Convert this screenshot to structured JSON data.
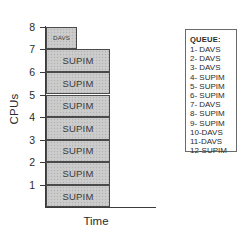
{
  "figure": {
    "y_axis_title": "CPUs",
    "x_axis_title": "Time",
    "y_ticks": [
      "1",
      "2",
      "3",
      "4",
      "5",
      "6",
      "7",
      "8"
    ],
    "y_axis_arrow_icon": "up-arrow-icon",
    "x_axis_arrow_icon": "right-arrow-icon"
  },
  "bars": [
    {
      "label": "DAVS",
      "cpu_from": 7,
      "cpu_to": 8,
      "size": "small"
    },
    {
      "label": "DAVS",
      "cpu_from": 6,
      "cpu_to": 7,
      "size": "small"
    },
    {
      "label": "SUPIM",
      "cpu_from": 6,
      "cpu_to": 7,
      "size": "large"
    },
    {
      "label": "SUPIM",
      "cpu_from": 5,
      "cpu_to": 6,
      "size": "large"
    },
    {
      "label": "SUPIM",
      "cpu_from": 4,
      "cpu_to": 5,
      "size": "large"
    },
    {
      "label": "SUPIM",
      "cpu_from": 3,
      "cpu_to": 4,
      "size": "large"
    },
    {
      "label": "SUPIM",
      "cpu_from": 2,
      "cpu_to": 3,
      "size": "large"
    },
    {
      "label": "SUPIM",
      "cpu_from": 1,
      "cpu_to": 2,
      "size": "large"
    },
    {
      "label": "SUPIM",
      "cpu_from": 0,
      "cpu_to": 1,
      "size": "large"
    }
  ],
  "queue": {
    "title": "QUEUE:",
    "items": [
      "1- DAVS",
      "2- DAVS",
      "3- DAVS",
      "4- SUPIM",
      "5- SUPIM",
      "6- SUPIM",
      "7- DAVS",
      "8- SUPIM",
      "9- SUPIM",
      "10-DAVS",
      "11-DAVS",
      "12-SUPIM"
    ]
  },
  "chart_data": {
    "type": "bar",
    "title": "",
    "xlabel": "Time",
    "ylabel": "CPUs",
    "ylim": [
      0,
      8
    ],
    "yticks": [
      1,
      2,
      3,
      4,
      5,
      6,
      7,
      8
    ],
    "grid": false,
    "legend": "none",
    "orientation": "horizontal-stacked-by-cpu",
    "categories": [
      "CPU 1",
      "CPU 2",
      "CPU 3",
      "CPU 4",
      "CPU 5",
      "CPU 6",
      "CPU 7",
      "CPU 8"
    ],
    "series": [
      {
        "name": "SUPIM",
        "values": [
          1,
          1,
          1,
          1,
          1,
          1,
          1,
          0
        ]
      },
      {
        "name": "DAVS",
        "values": [
          0,
          0,
          0,
          0,
          0,
          0,
          1,
          1
        ]
      }
    ],
    "annotations": [
      "Seven SUPIM tasks occupy CPUs 1-7 with long duration",
      "Two DAVS tasks occupy CPUs 7-8 with short duration"
    ]
  },
  "colors": {
    "bar_fill": "#c9c9c9",
    "bar_border": "#4a4a4a",
    "axis": "#3b3b3b",
    "text": "#2b2b2b",
    "panel_border": "#6a6a6a",
    "background": "#ffffff"
  }
}
